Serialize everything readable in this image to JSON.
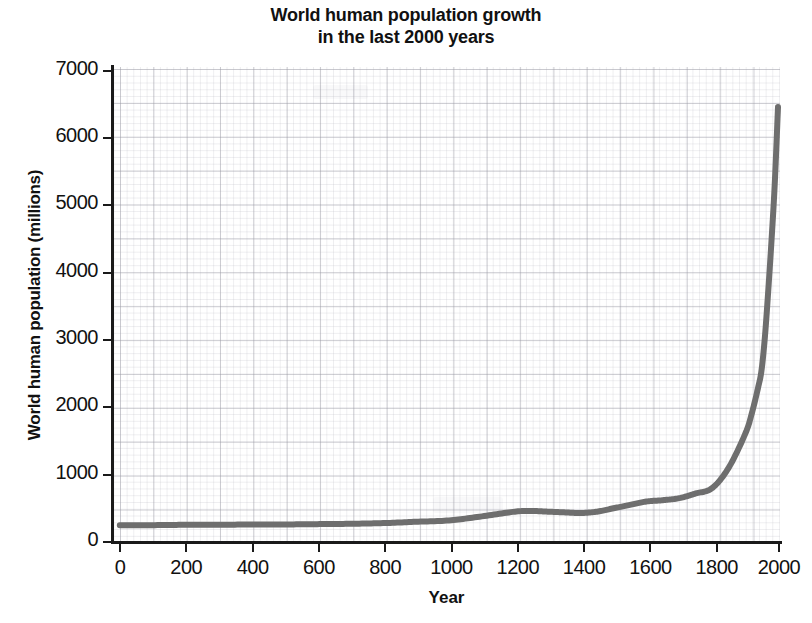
{
  "chart_data": {
    "type": "line",
    "title": "World human population growth in the last 2000 years",
    "title_line1": "World human population growth",
    "title_line2": "in the last 2000 years",
    "xlabel": "Year",
    "ylabel": "World human population (millions)",
    "xlim": [
      0,
      2000
    ],
    "ylim": [
      0,
      7000
    ],
    "xticks": [
      0,
      200,
      400,
      600,
      800,
      1000,
      1200,
      1400,
      1600,
      1800,
      2000
    ],
    "xtick_labels": [
      "0",
      "200",
      "400",
      "600",
      "800",
      "1000",
      "1200",
      "1400",
      "1600",
      "1800",
      "2000"
    ],
    "yticks": [
      0,
      1000,
      2000,
      3000,
      4000,
      5000,
      6000,
      7000
    ],
    "ytick_labels": [
      "0",
      "1000",
      "2000",
      "3000",
      "4000",
      "5000",
      "6000",
      "7000"
    ],
    "grid": "graph-paper minor and major gridlines",
    "legend": null,
    "series": [
      {
        "name": "World human population",
        "color": "#6e6e6e",
        "line_width_px": 6,
        "x": [
          0,
          100,
          200,
          300,
          400,
          500,
          600,
          700,
          800,
          900,
          1000,
          1100,
          1200,
          1250,
          1300,
          1350,
          1400,
          1450,
          1500,
          1550,
          1600,
          1650,
          1700,
          1750,
          1800,
          1850,
          1900,
          1920,
          1940,
          1950,
          1960,
          1970,
          1980,
          1990,
          2000
        ],
        "values": [
          250,
          250,
          255,
          255,
          260,
          260,
          265,
          270,
          280,
          300,
          320,
          380,
          450,
          460,
          450,
          440,
          430,
          450,
          500,
          550,
          600,
          620,
          650,
          720,
          800,
          1100,
          1600,
          1900,
          2300,
          2550,
          3030,
          3700,
          4450,
          5300,
          6450
        ]
      }
    ]
  },
  "axis": {
    "y_title": "World human population (millions)",
    "x_title": "Year"
  },
  "colors": {
    "curve": "#6e6e6e",
    "axis": "#1a1a1a",
    "grid_major": "#9698a0",
    "grid_minor": "#b2b2bc",
    "background": "#ffffff",
    "text": "#111111"
  }
}
